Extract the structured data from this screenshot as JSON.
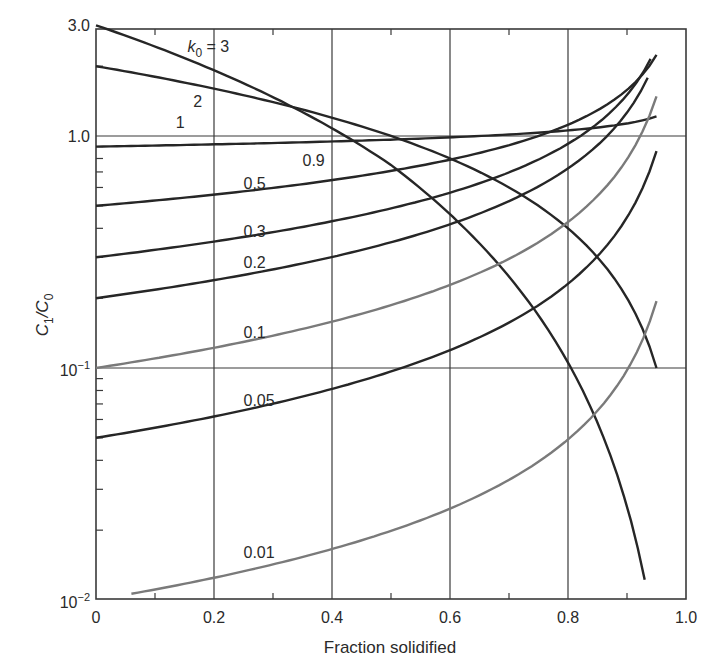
{
  "chart_data": {
    "type": "line",
    "title": "",
    "xlabel": "Fraction solidified",
    "ylabel": "C1/C0",
    "ylabel_main": "C",
    "ylabel_sub1": "1",
    "ylabel_slash": "/C",
    "ylabel_sub0": "0",
    "xscale": "linear",
    "yscale": "log",
    "xlim": [
      0,
      1.0
    ],
    "ylim": [
      0.01,
      3.0
    ],
    "grid": true,
    "x_ticks": [
      {
        "value": 0,
        "label": "0"
      },
      {
        "value": 0.2,
        "label": "0.2"
      },
      {
        "value": 0.4,
        "label": "0.4"
      },
      {
        "value": 0.6,
        "label": "0.6"
      },
      {
        "value": 0.8,
        "label": "0.8"
      },
      {
        "value": 1.0,
        "label": "1.0"
      }
    ],
    "y_ticks": [
      {
        "value": 3.0,
        "label": "3.0",
        "kind": "plain"
      },
      {
        "value": 1.0,
        "label": "1.0",
        "kind": "plain"
      },
      {
        "value": 0.1,
        "label": "10",
        "exp": "−1",
        "kind": "pow"
      },
      {
        "value": 0.01,
        "label": "10",
        "exp": "−2",
        "kind": "pow"
      }
    ],
    "legend": "none (curves labeled inline with k0 values)",
    "series": [
      {
        "name": "k0 = 3",
        "k0": 3,
        "color": "#262626",
        "x": [
          0,
          0.1,
          0.2,
          0.3,
          0.4,
          0.5,
          0.6,
          0.7,
          0.8,
          0.9,
          0.93
        ],
        "values": [
          3.0,
          2.43,
          1.92,
          1.47,
          1.08,
          0.75,
          0.48,
          0.27,
          0.12,
          0.03,
          0.0147
        ],
        "label": {
          "text": "k",
          "sub": "0",
          "suffix": " = 3",
          "x": 0.155,
          "y_px": 52
        }
      },
      {
        "name": "k0 = 2",
        "k0": 2,
        "color": "#262626",
        "x": [
          0,
          0.1,
          0.2,
          0.3,
          0.4,
          0.5,
          0.6,
          0.7,
          0.8,
          0.9,
          0.95
        ],
        "values": [
          2.0,
          1.8,
          1.6,
          1.4,
          1.2,
          1.0,
          0.8,
          0.6,
          0.4,
          0.2,
          0.1
        ],
        "label": {
          "text": "2",
          "x": 0.165,
          "y_px": 107
        }
      },
      {
        "name": "k0 = 1",
        "k0": 1,
        "color": "#262626",
        "x": [
          0,
          1.0
        ],
        "values": [
          1.0,
          1.0
        ],
        "label": {
          "text": "1",
          "x": 0.135,
          "y_px": 128
        }
      },
      {
        "name": "k0 = 0.9",
        "k0": 0.9,
        "color": "#262626",
        "x": [
          0,
          0.1,
          0.2,
          0.3,
          0.4,
          0.5,
          0.6,
          0.7,
          0.8,
          0.9,
          0.95
        ],
        "values": [
          0.9,
          0.909,
          0.92,
          0.932,
          0.947,
          0.965,
          0.988,
          1.018,
          1.059,
          1.131,
          1.215
        ],
        "label": {
          "text": "0.9",
          "x": 0.35,
          "y_px": 166
        }
      },
      {
        "name": "k0 = 0.5",
        "k0": 0.5,
        "color": "#262626",
        "x": [
          0,
          0.1,
          0.2,
          0.3,
          0.4,
          0.5,
          0.6,
          0.7,
          0.8,
          0.9,
          0.95
        ],
        "values": [
          0.5,
          0.527,
          0.559,
          0.598,
          0.645,
          0.707,
          0.791,
          0.913,
          1.118,
          1.581,
          2.236
        ],
        "label": {
          "text": "0.5",
          "x": 0.25,
          "y_px": 189
        }
      },
      {
        "name": "k0 = 0.3",
        "k0": 0.3,
        "color": "#262626",
        "x": [
          0,
          0.1,
          0.2,
          0.3,
          0.4,
          0.5,
          0.6,
          0.7,
          0.8,
          0.9,
          0.94
        ],
        "values": [
          0.3,
          0.323,
          0.351,
          0.385,
          0.428,
          0.485,
          0.571,
          0.693,
          0.925,
          1.504,
          2.15
        ],
        "label": {
          "text": "0.3",
          "x": 0.25,
          "y_px": 237
        }
      },
      {
        "name": "k0 = 0.2",
        "k0": 0.2,
        "color": "#262626",
        "x": [
          0,
          0.1,
          0.2,
          0.3,
          0.4,
          0.5,
          0.6,
          0.7,
          0.8,
          0.9,
          0.935
        ],
        "values": [
          0.2,
          0.218,
          0.239,
          0.266,
          0.301,
          0.348,
          0.416,
          0.523,
          0.724,
          1.262,
          1.78
        ],
        "label": {
          "text": "0.2",
          "x": 0.25,
          "y_px": 268
        }
      },
      {
        "name": "k0 = 0.1",
        "k0": 0.1,
        "color": "#7a7a7a",
        "x": [
          0,
          0.1,
          0.2,
          0.3,
          0.4,
          0.5,
          0.6,
          0.7,
          0.8,
          0.9,
          0.95
        ],
        "values": [
          0.1,
          0.11,
          0.122,
          0.138,
          0.158,
          0.187,
          0.228,
          0.295,
          0.426,
          0.794,
          1.48
        ],
        "label": {
          "text": "0.1",
          "x": 0.25,
          "y_px": 338
        }
      },
      {
        "name": "k0 = 0.05",
        "k0": 0.05,
        "color": "#262626",
        "x": [
          0,
          0.1,
          0.2,
          0.3,
          0.4,
          0.5,
          0.6,
          0.7,
          0.8,
          0.9,
          0.95
        ],
        "values": [
          0.05,
          0.0552,
          0.0617,
          0.07,
          0.081,
          0.0964,
          0.1193,
          0.1574,
          0.2326,
          0.4468,
          0.863
        ],
        "label": {
          "text": "0.05",
          "x": 0.25,
          "y_px": 406
        }
      },
      {
        "name": "k0 = 0.01",
        "k0": 0.01,
        "color": "#7a7a7a",
        "x": [
          0.06,
          0.1,
          0.2,
          0.3,
          0.4,
          0.5,
          0.6,
          0.7,
          0.8,
          0.9,
          0.95
        ],
        "values": [
          0.0106,
          0.0111,
          0.0125,
          0.0143,
          0.0166,
          0.0199,
          0.0248,
          0.033,
          0.0493,
          0.0977,
          0.194
        ],
        "label": {
          "text": "0.01",
          "x": 0.25,
          "y_px": 558
        }
      }
    ]
  },
  "layout": {
    "plot_left": 96,
    "plot_right": 686,
    "plot_top": 29,
    "plot_bottom": 599,
    "y_one_px": 136,
    "decade_px": 232,
    "axis_color": "#3a3a3a",
    "grid_color": "#3a3a3a"
  }
}
